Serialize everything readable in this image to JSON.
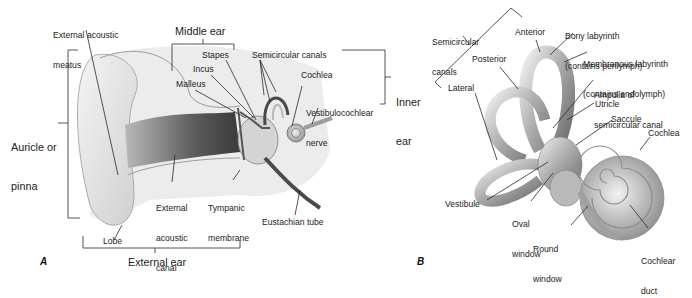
{
  "panels": {
    "a": {
      "letter": "A",
      "title": "Ear anatomy overview",
      "labels": {
        "external_acoustic_meatus_1": "External acoustic",
        "external_acoustic_meatus_2": "meatus",
        "middle_ear": "Middle ear",
        "stapes": "Stapes",
        "incus": "Incus",
        "malleus": "Malleus",
        "semicircular_canals": "Semicircular canals",
        "cochlea": "Cochlea",
        "vestibulocochlear_nerve_1": "Vestibulocochlear",
        "vestibulocochlear_nerve_2": "nerve",
        "inner_ear_1": "Inner",
        "inner_ear_2": "ear",
        "auricle_1": "Auricle or",
        "auricle_2": "pinna",
        "external_acoustic_canal_1": "External",
        "external_acoustic_canal_2": "acoustic",
        "external_acoustic_canal_3": "canal",
        "tympanic_membrane_1": "Tympanic",
        "tympanic_membrane_2": "membrane",
        "eustachian_tube": "Eustachian tube",
        "lobe": "Lobe",
        "external_ear": "External ear"
      }
    },
    "b": {
      "letter": "B",
      "title": "Inner ear labyrinth",
      "labels": {
        "semicircular_canals_1": "Semicircular",
        "semicircular_canals_2": "canals",
        "anterior": "Anterior",
        "posterior": "Posterior",
        "lateral": "Lateral",
        "bony_labyrinth_1": "Bony labyrinth",
        "bony_labyrinth_2": "(contains perilymph)",
        "membranous_labyrinth_1": "Membranous labyrinth",
        "membranous_labyrinth_2": "(contains endolymph)",
        "ampulla_1": "Ampulla of",
        "ampulla_2": "semicircular canal",
        "utricle": "Utricle",
        "saccule": "Saccule",
        "cochlea": "Cochlea",
        "vestibule": "Vestibule",
        "oval_window_1": "Oval",
        "oval_window_2": "window",
        "round_window_1": "Round",
        "round_window_2": "window",
        "cochlear_duct_1": "Cochlear",
        "cochlear_duct_2": "duct"
      }
    }
  },
  "colors": {
    "line": "#2a2a2a",
    "tissue_light": "#e6e6e6",
    "tissue_mid": "#bdbdbd",
    "tissue_dark": "#5a5a5a",
    "bone": "#d8d8d8"
  }
}
